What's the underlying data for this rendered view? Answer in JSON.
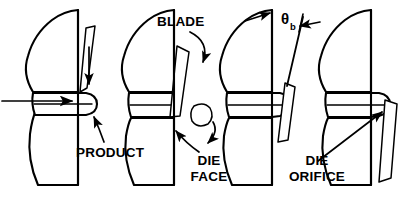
{
  "figure": {
    "background_color": "#ffffff",
    "line_color": "#000000",
    "panel_count": 4
  },
  "labels": {
    "blade": "BLADE",
    "product": "PRODUCT",
    "die_face_line1": "DIE",
    "die_face_line2": "FACE",
    "die_orifice_line1": "DIE",
    "die_orifice_line2": "ORIFICE",
    "blade_angle_symbol": "θ",
    "blade_angle_subscript": "b"
  },
  "panels": [
    {
      "index": 1,
      "name": "panel-approach",
      "caption_labels": [
        "PRODUCT"
      ],
      "has_blade": true,
      "blade_state": "descending-above-product",
      "has_product": true,
      "product_state": "fully-extruded-rounded-tip",
      "has_flow_arrow": true,
      "has_severed_pellet": false
    },
    {
      "index": 2,
      "name": "panel-cut",
      "caption_labels": [
        "BLADE",
        "DIE",
        "FACE"
      ],
      "has_blade": true,
      "blade_state": "cutting-through-at-die-face",
      "has_product": true,
      "product_state": "sheared-flat-at-die-face",
      "has_flow_arrow": false,
      "has_severed_pellet": true
    },
    {
      "index": 3,
      "name": "panel-angle",
      "caption_labels": [
        "θb"
      ],
      "has_blade": true,
      "blade_state": "past-orifice-angled",
      "has_product": true,
      "product_state": "re-emerging",
      "has_flow_arrow": false,
      "has_severed_pellet": false
    },
    {
      "index": 4,
      "name": "panel-regrowth",
      "caption_labels": [
        "DIE",
        "ORIFICE"
      ],
      "has_blade": true,
      "blade_state": "clear-of-orifice",
      "has_product": true,
      "product_state": "fully-extruded-rounded-tip",
      "has_flow_arrow": false,
      "has_severed_pellet": false
    }
  ]
}
